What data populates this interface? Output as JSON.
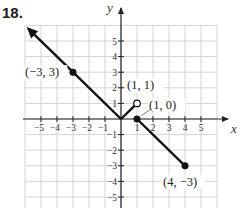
{
  "problem_number": "18.",
  "chart_data": {
    "type": "line",
    "title": "",
    "xlabel": "x",
    "ylabel": "y",
    "xlim": [
      -6,
      6
    ],
    "ylim": [
      -6,
      6
    ],
    "grid": true,
    "x_ticks": [
      -5,
      -4,
      -3,
      -2,
      -1,
      1,
      2,
      3,
      4,
      5
    ],
    "y_ticks": [
      -5,
      -4,
      -3,
      -2,
      -1,
      1,
      2,
      3,
      4,
      5
    ],
    "x_tick_labels": [
      "−5",
      "−4",
      "−3",
      "−2",
      "−1",
      "1",
      "2",
      "3",
      "4",
      "5"
    ],
    "y_tick_labels": [
      "−5",
      "−4",
      "−3",
      "−2",
      "−1",
      "1",
      "2",
      "3",
      "4",
      "5"
    ],
    "series": [
      {
        "name": "piece-1",
        "description": "ray with arrow extending to upper-left, y = -x for x <= 0",
        "points": [
          [
            -5.8,
            5.8
          ],
          [
            -3,
            3
          ],
          [
            0,
            0
          ]
        ],
        "arrow_start": true
      },
      {
        "name": "piece-2",
        "description": "segment y = x for 0 < x < 1, open at (1,1)",
        "points": [
          [
            0,
            0
          ],
          [
            1,
            1
          ]
        ],
        "open_end": true
      },
      {
        "name": "piece-3",
        "description": "segment y = -x + 1 for 1 <= x <= 4",
        "points": [
          [
            1,
            0
          ],
          [
            4,
            -3
          ]
        ],
        "closed_start": true,
        "closed_end": true
      }
    ],
    "annotations": [
      {
        "text": "(−3, 3)",
        "point": [
          -3,
          3
        ],
        "marker": "closed"
      },
      {
        "text": "(1, 1)",
        "point": [
          1,
          1
        ],
        "marker": "open"
      },
      {
        "text": "(1, 0)",
        "point": [
          1,
          0
        ],
        "marker": "closed"
      },
      {
        "text": "(4, −3)",
        "point": [
          4,
          -3
        ],
        "marker": "closed"
      }
    ]
  }
}
